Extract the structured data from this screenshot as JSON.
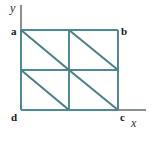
{
  "figure": {
    "colors": {
      "shape_stroke": "#4e8b90",
      "diagonal_stroke": "#4a7f84",
      "axis_stroke": "#8a8f92",
      "label_text": "#1a1a1a",
      "background": "#ffffff"
    },
    "axes": {
      "x_label": "x",
      "y_label": "y",
      "origin_x": 21,
      "origin_y": 110,
      "x_axis_end": 146,
      "y_axis_top": 5
    },
    "vertices": [
      {
        "id": "a",
        "label": "a",
        "corner": "top-left",
        "x": 21,
        "y": 30
      },
      {
        "id": "b",
        "label": "b",
        "corner": "top-right",
        "x": 118,
        "y": 30
      },
      {
        "id": "c",
        "label": "c",
        "corner": "bottom-right",
        "x": 118,
        "y": 110
      },
      {
        "id": "d",
        "label": "d",
        "corner": "bottom-left",
        "x": 21,
        "y": 110
      }
    ],
    "grid": {
      "mid_x": 69,
      "mid_y": 70,
      "rows": 2,
      "cols": 2
    },
    "diagonals": [
      {
        "id": "diag-top-left",
        "x1": 21,
        "y1": 30,
        "x2": 69,
        "y2": 70
      },
      {
        "id": "diag-top-right",
        "x1": 69,
        "y1": 30,
        "x2": 118,
        "y2": 70
      },
      {
        "id": "diag-bottom-left",
        "x1": 21,
        "y1": 70,
        "x2": 69,
        "y2": 110
      },
      {
        "id": "diag-bottom-right",
        "x1": 69,
        "y1": 70,
        "x2": 118,
        "y2": 110
      }
    ]
  }
}
